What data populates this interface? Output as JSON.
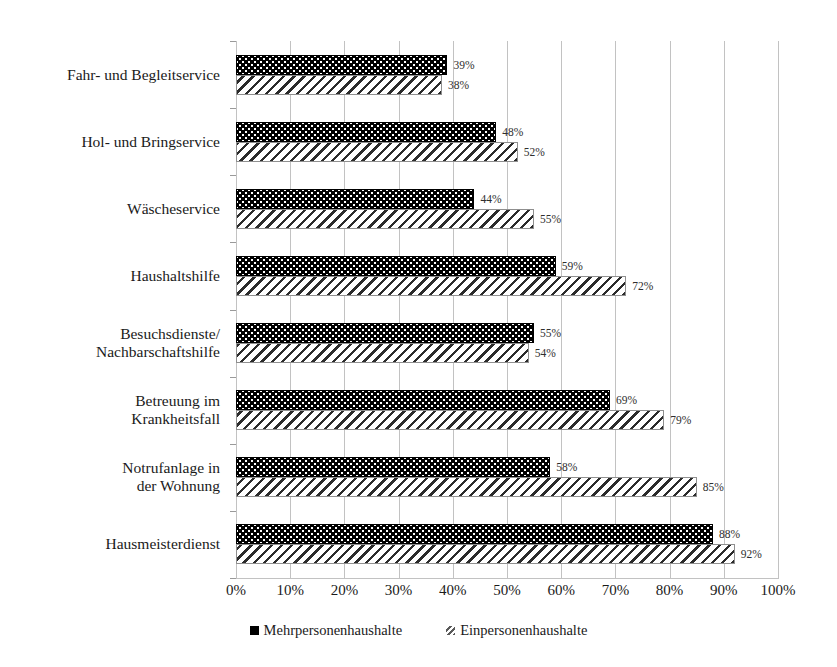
{
  "chart_data": {
    "type": "bar",
    "orientation": "horizontal",
    "title": "",
    "xlabel": "",
    "ylabel": "",
    "xlim": [
      0,
      100
    ],
    "xticks": [
      "0%",
      "10%",
      "20%",
      "30%",
      "40%",
      "50%",
      "60%",
      "70%",
      "80%",
      "90%",
      "100%"
    ],
    "xtick_values": [
      0,
      10,
      20,
      30,
      40,
      50,
      60,
      70,
      80,
      90,
      100
    ],
    "grid": "vertical",
    "legend_position": "bottom-center",
    "categories": [
      "Fahr- und Begleitservice",
      "Hol- und Bringservice",
      "Wäscheservice",
      "Haushaltshilfe",
      "Besuchsdienste/\nNachbarschaftshilfe",
      "Betreuung im\nKrankheitsfall",
      "Notrufanlage in\nder Wohnung",
      "Hausmeisterdienst"
    ],
    "series": [
      {
        "name": "Mehrpersonenhaushalte",
        "pattern": "black-dotted",
        "values": [
          39,
          48,
          44,
          59,
          55,
          69,
          58,
          88
        ],
        "labels": [
          "39%",
          "48%",
          "44%",
          "59%",
          "55%",
          "69%",
          "58%",
          "88%"
        ]
      },
      {
        "name": "Einpersonenhaushalte",
        "pattern": "diagonal-hatch",
        "values": [
          38,
          52,
          55,
          72,
          54,
          79,
          85,
          92
        ],
        "labels": [
          "38%",
          "52%",
          "55%",
          "72%",
          "54%",
          "79%",
          "85%",
          "92%"
        ]
      }
    ]
  },
  "colors": {
    "series_multi": "#000000",
    "series_single": "#ffffff",
    "hatch": "#2b2b2b",
    "gridline": "#c2c2c2",
    "axis": "#9a9a9a",
    "text": "#1a1a1a",
    "value_text": "#2e2e2e",
    "background": "#ffffff"
  }
}
